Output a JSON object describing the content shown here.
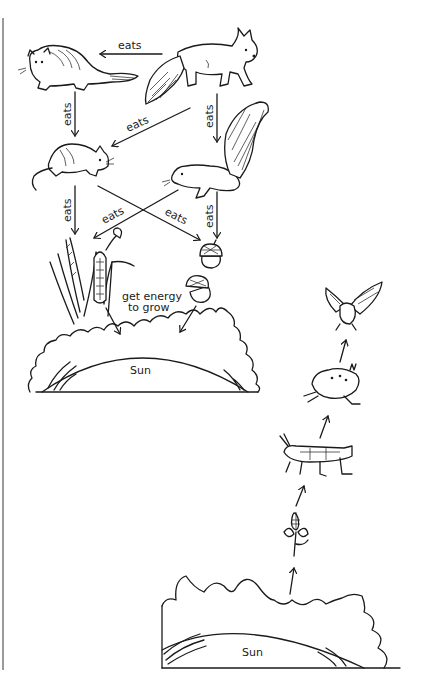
{
  "diagram": {
    "title": "",
    "food_web": {
      "nodes": [
        {
          "id": "fox",
          "label": "fox"
        },
        {
          "id": "weasel",
          "label": "weasel"
        },
        {
          "id": "mouse",
          "label": "mouse"
        },
        {
          "id": "squirrel",
          "label": "squirrel"
        },
        {
          "id": "grass_corn",
          "label": "grass and corn plants"
        },
        {
          "id": "acorns",
          "label": "acorns"
        },
        {
          "id": "sun",
          "label": "Sun"
        }
      ],
      "edges": [
        {
          "from": "fox",
          "to": "weasel",
          "label": "eats"
        },
        {
          "from": "weasel",
          "to": "mouse",
          "label": "eats"
        },
        {
          "from": "fox",
          "to": "mouse",
          "label": "eats"
        },
        {
          "from": "fox",
          "to": "squirrel",
          "label": "eats"
        },
        {
          "from": "mouse",
          "to": "grass_corn",
          "label": "eats"
        },
        {
          "from": "squirrel",
          "to": "grass_corn",
          "label": "eats"
        },
        {
          "from": "mouse",
          "to": "acorns",
          "label": "eats"
        },
        {
          "from": "squirrel",
          "to": "acorns",
          "label": "eats"
        },
        {
          "from": "plants",
          "to": "sun",
          "label": "get energy to grow"
        }
      ],
      "labels": {
        "eats": "eats",
        "energy_line1": "get energy",
        "energy_line2": "to grow",
        "sun": "Sun"
      }
    },
    "food_chain": {
      "nodes": [
        {
          "id": "sun",
          "label": "Sun"
        },
        {
          "id": "clover",
          "label": "clover"
        },
        {
          "id": "grasshopper",
          "label": "grasshopper"
        },
        {
          "id": "frog",
          "label": "frog"
        },
        {
          "id": "hawk",
          "label": "hawk"
        }
      ],
      "order": [
        "sun",
        "clover",
        "grasshopper",
        "frog",
        "hawk"
      ],
      "labels": {
        "sun": "Sun"
      }
    }
  }
}
